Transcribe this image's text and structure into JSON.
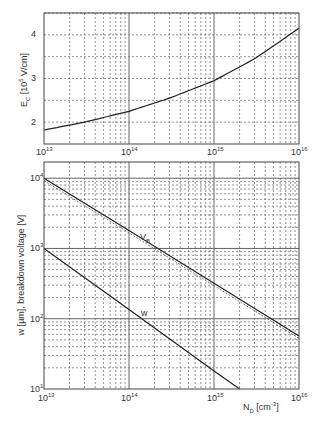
{
  "chart_data": [
    {
      "type": "line",
      "title": "",
      "xlabel": "N_D [cm^-3]",
      "ylabel": "E_C [10^5 V/cm]",
      "xscale": "log",
      "yscale": "linear",
      "xlim": [
        10000000000000.0,
        1e+16
      ],
      "ylim": [
        1.5,
        4.5
      ],
      "grid": true,
      "x_tick_labels": [
        "10^13",
        "10^14",
        "10^15",
        "10^16"
      ],
      "y_tick_labels": [
        "2",
        "3",
        "4"
      ],
      "series": [
        {
          "name": "E_C",
          "x": [
            10000000000000.0,
            30000000000000.0,
            100000000000000.0,
            300000000000000.0,
            1000000000000000.0,
            3000000000000000.0,
            1e+16
          ],
          "values": [
            1.82,
            2.0,
            2.25,
            2.55,
            2.95,
            3.45,
            4.15
          ]
        }
      ]
    },
    {
      "type": "line",
      "title": "",
      "xlabel": "N_D [cm^-3]",
      "ylabel": "w [µm], breakdown voltage [V]",
      "xscale": "log",
      "yscale": "log",
      "xlim": [
        10000000000000.0,
        1e+16
      ],
      "ylim": [
        10,
        17000
      ],
      "grid": true,
      "x_tick_labels": [
        "10^13",
        "10^14",
        "10^15",
        "10^16"
      ],
      "y_tick_labels": [
        "10^1",
        "10^2",
        "10^3",
        "10^4"
      ],
      "annotations": [
        "V_B",
        "w"
      ],
      "series": [
        {
          "name": "V_B",
          "x": [
            10000000000000.0,
            100000000000000.0,
            1000000000000000.0,
            1e+16
          ],
          "values": [
            10000,
            1800,
            320,
            57
          ]
        },
        {
          "name": "w",
          "x": [
            10000000000000.0,
            100000000000000.0,
            1000000000000000.0,
            2000000000000000.0
          ],
          "values": [
            1000,
            135,
            18,
            10
          ]
        }
      ]
    }
  ],
  "top": {
    "ylabel_main": "E",
    "ylabel_sub": "C",
    "ylabel_rest": " [10",
    "ylabel_sup": "5",
    "ylabel_end": " V/cm]",
    "yticks": [
      "2",
      "3",
      "4"
    ],
    "xticks": [
      {
        "base": "10",
        "exp": "13"
      },
      {
        "base": "10",
        "exp": "14"
      },
      {
        "base": "10",
        "exp": "15"
      },
      {
        "base": "10",
        "exp": "16"
      }
    ]
  },
  "bottom": {
    "ylabel": "w [µm], breakdown voltage [V]",
    "yticks": [
      {
        "base": "10",
        "exp": "4"
      },
      {
        "base": "10",
        "exp": "3"
      },
      {
        "base": "10",
        "exp": "2"
      },
      {
        "base": "10",
        "exp": "1"
      }
    ],
    "xticks": [
      {
        "base": "10",
        "exp": "13"
      },
      {
        "base": "10",
        "exp": "14"
      },
      {
        "base": "10",
        "exp": "15"
      },
      {
        "base": "10",
        "exp": "16"
      }
    ],
    "xlabel_main": "N",
    "xlabel_sub": "D",
    "xlabel_rest": " [cm",
    "xlabel_sup": "-3",
    "xlabel_end": "]",
    "vb_label_main": "V",
    "vb_label_sub": "B",
    "w_label": "w"
  }
}
